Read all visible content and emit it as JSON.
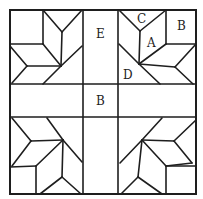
{
  "diagram": {
    "type": "quilt-block-pattern",
    "colors": {
      "line": "#1e1e1e",
      "background": "#ffffff"
    },
    "labels": [
      {
        "id": "label-c",
        "text": "C",
        "x": 137,
        "y": 23
      },
      {
        "id": "label-b-corner",
        "text": "B",
        "x": 177,
        "y": 30
      },
      {
        "id": "label-a",
        "text": "A",
        "x": 147,
        "y": 47
      },
      {
        "id": "label-e",
        "text": "E",
        "x": 96,
        "y": 38
      },
      {
        "id": "label-d",
        "text": "D",
        "x": 123,
        "y": 79
      },
      {
        "id": "label-b-center",
        "text": "B",
        "x": 96,
        "y": 105
      }
    ],
    "grid": {
      "outer": {
        "x1": 10,
        "y1": 10,
        "x2": 196,
        "y2": 194
      },
      "vertical_lines": [
        83,
        118
      ],
      "horizontal_lines": [
        84,
        117
      ]
    },
    "blocks": {
      "top_left": [
        [
          43,
          10,
          43,
          44
        ],
        [
          10,
          44,
          43,
          44
        ],
        [
          43,
          10,
          62,
          32
        ],
        [
          82,
          10,
          62,
          32
        ],
        [
          62,
          32,
          61,
          66
        ],
        [
          43,
          44,
          61,
          66
        ],
        [
          10,
          46,
          27,
          66
        ],
        [
          27,
          66,
          61,
          66
        ],
        [
          27,
          66,
          12,
          83
        ],
        [
          61,
          66,
          43,
          84
        ],
        [
          82,
          46,
          61,
          66
        ]
      ],
      "top_right": [
        [
          119,
          10,
          140,
          31
        ],
        [
          166,
          10,
          140,
          31
        ],
        [
          140,
          31,
          139,
          64
        ],
        [
          166,
          10,
          166,
          44
        ],
        [
          166,
          44,
          196,
          44
        ],
        [
          166,
          44,
          139,
          64
        ],
        [
          196,
          44,
          175,
          67
        ],
        [
          139,
          64,
          175,
          67
        ],
        [
          175,
          67,
          193,
          84
        ],
        [
          139,
          64,
          160,
          84
        ],
        [
          119,
          44,
          139,
          64
        ]
      ],
      "bottom_left": [
        [
          12,
          118,
          31,
          141
        ],
        [
          31,
          141,
          63,
          140
        ],
        [
          47,
          118,
          63,
          140
        ],
        [
          63,
          140,
          82,
          162
        ],
        [
          63,
          140,
          36,
          166
        ],
        [
          10,
          167,
          36,
          166
        ],
        [
          31,
          141,
          12,
          166
        ],
        [
          36,
          166,
          36,
          194
        ],
        [
          63,
          140,
          62,
          177
        ],
        [
          62,
          177,
          40,
          194
        ],
        [
          62,
          177,
          81,
          194
        ]
      ],
      "bottom_right": [
        [
          162,
          118,
          142,
          140
        ],
        [
          142,
          140,
          120,
          163
        ],
        [
          142,
          140,
          174,
          141
        ],
        [
          174,
          141,
          196,
          120
        ],
        [
          142,
          140,
          166,
          166
        ],
        [
          166,
          166,
          192,
          163
        ],
        [
          174,
          141,
          192,
          163
        ],
        [
          166,
          166,
          196,
          166
        ],
        [
          166,
          166,
          166,
          194
        ],
        [
          142,
          140,
          138,
          177
        ],
        [
          138,
          177,
          121,
          194
        ],
        [
          138,
          177,
          162,
          194
        ]
      ]
    }
  }
}
